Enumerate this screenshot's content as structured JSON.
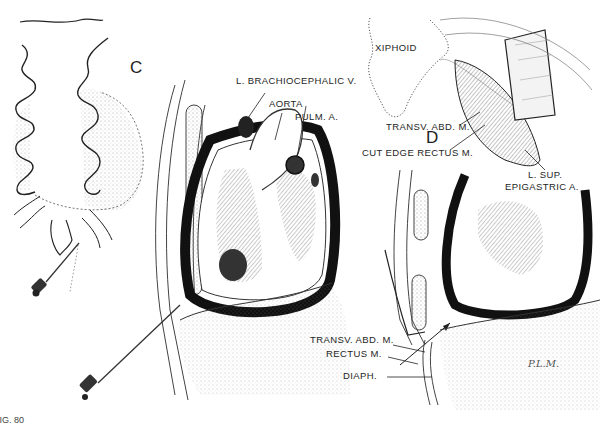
{
  "figure": {
    "caption_fragment": "FIG. 80",
    "panels": [
      {
        "id": "C",
        "label": "C"
      },
      {
        "id": "D",
        "label": "D"
      }
    ],
    "labels": {
      "l_brachiocephalic_v": "L. BRACHIOCEPHALIC V.",
      "aorta": "AORTA",
      "pulm_a": "PULM. A.",
      "xiphoid": "XIPHOID",
      "transv_abd_m_top": "TRANSV. ABD. M.",
      "cut_edge_rectus_m": "CUT EDGE RECTUS M.",
      "l_sup_epigastric_a_line1": "L. SUP.",
      "l_sup_epigastric_a_line2": "EPIGASTRIC A.",
      "transv_abd_m_bottom": "TRANSV. ABD. M.",
      "rectus_m": "RECTUS M.",
      "diaph": "DIAPH."
    },
    "signature": "P.L.M."
  }
}
